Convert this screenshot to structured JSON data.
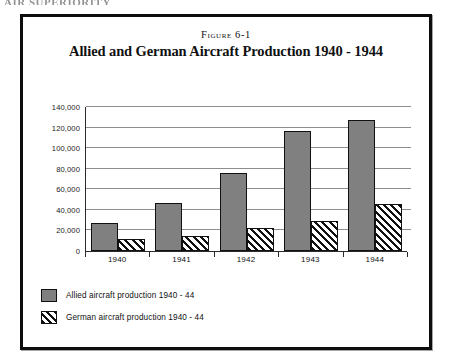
{
  "page": {
    "running_head": "AIR SUPERIORITY"
  },
  "figure": {
    "number_label": "Figure 6-1",
    "title": "Allied and German Aircraft Production 1940 - 1944"
  },
  "chart_data": {
    "type": "bar",
    "title": "Allied and German Aircraft Production 1940 - 1944",
    "xlabel": "",
    "ylabel": "",
    "categories": [
      "1940",
      "1941",
      "1942",
      "1943",
      "1944"
    ],
    "series": [
      {
        "name": "Allied aircraft production 1940 - 44",
        "color": "#808080",
        "fill": "solid-gray",
        "values": [
          27000,
          47000,
          76000,
          117000,
          127000
        ]
      },
      {
        "name": "German aircraft production 1940 - 44",
        "color": "#111111",
        "fill": "diagonal-hatch",
        "values": [
          12000,
          15000,
          22000,
          29000,
          46000
        ]
      }
    ],
    "ylim": [
      0,
      140000
    ],
    "ytick_values": [
      0,
      20000,
      40000,
      60000,
      80000,
      100000,
      120000,
      140000
    ],
    "ytick_labels": [
      "0",
      "20,000",
      "40,000",
      "60,000",
      "80,000",
      "100,000",
      "120,000",
      "140,000"
    ],
    "grid": "horizontal",
    "legend_position": "bottom-left"
  },
  "legend": {
    "items": [
      {
        "label": "Allied aircraft production 1940 - 44"
      },
      {
        "label": "German aircraft production 1940 - 44"
      }
    ]
  }
}
